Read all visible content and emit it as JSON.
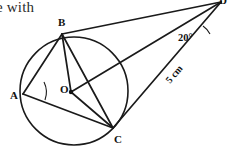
{
  "document_fragment": {
    "text": "e with"
  },
  "figure": {
    "type": "circle-geometry-diagram",
    "stroke_color": "#1a1a1a",
    "fill_color": "#ffffff",
    "canvas": {
      "width": 229,
      "height": 152
    },
    "circle": {
      "label": "O",
      "center": {
        "x": 74,
        "y": 91
      },
      "radius": 54,
      "center_dot_radius": 2.2
    },
    "points": [
      {
        "name": "A",
        "label": "A",
        "x": 23,
        "y": 94,
        "label_x": 10,
        "label_y": 99,
        "on_circle": true
      },
      {
        "name": "B",
        "label": "B",
        "x": 62,
        "y": 34,
        "label_x": 58,
        "label_y": 26,
        "on_circle": true
      },
      {
        "name": "C",
        "label": "C",
        "x": 113,
        "y": 128,
        "label_x": 114,
        "label_y": 143,
        "on_circle": true
      },
      {
        "name": "O",
        "label": "O",
        "x": 71,
        "y": 92,
        "label_x": 60,
        "label_y": 93,
        "on_circle": false
      },
      {
        "name": "D",
        "label": "D",
        "x": 221,
        "y": 2,
        "label_x": 219,
        "label_y": 4,
        "on_circle": false
      }
    ],
    "segments": [
      {
        "name": "A-B",
        "from": "A",
        "to": "B",
        "x1": 23,
        "y1": 94,
        "x2": 62,
        "y2": 34
      },
      {
        "name": "A-C",
        "from": "A",
        "to": "C",
        "x1": 23,
        "y1": 94,
        "x2": 113,
        "y2": 128
      },
      {
        "name": "B-O",
        "from": "B",
        "to": "O",
        "x1": 62,
        "y1": 34,
        "x2": 71,
        "y2": 92
      },
      {
        "name": "B-C",
        "from": "B",
        "to": "C",
        "x1": 62,
        "y1": 34,
        "x2": 113,
        "y2": 128
      },
      {
        "name": "B-D",
        "from": "B",
        "to": "D",
        "x1": 62,
        "y1": 34,
        "x2": 221,
        "y2": 2
      },
      {
        "name": "O-C",
        "from": "O",
        "to": "C",
        "x1": 71,
        "y1": 92,
        "x2": 113,
        "y2": 128
      },
      {
        "name": "O-D",
        "from": "O",
        "to": "D",
        "x1": 71,
        "y1": 92,
        "x2": 221,
        "y2": 2
      },
      {
        "name": "C-D",
        "from": "C",
        "to": "D",
        "x1": 113,
        "y1": 128,
        "x2": 221,
        "y2": 2
      }
    ],
    "annotations": {
      "angle_at_d": {
        "value": "20°",
        "x": 178,
        "y": 41,
        "arc_path": "M 203 26 A 22 22 0 0 1 210 34",
        "vertex": "D"
      },
      "angle_arc_at_a": {
        "arc_path": "M 44 82 A 23 23 0 0 1 45 100",
        "vertex": "A"
      },
      "length_cd": {
        "value": "5 cm",
        "x": 170,
        "y": 84,
        "rotation": -49,
        "segment": "C-D"
      }
    }
  }
}
